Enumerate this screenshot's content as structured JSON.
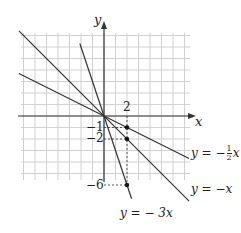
{
  "axes": {
    "x_label": "x",
    "y_label": "y"
  },
  "ticks": {
    "x_2": "2",
    "y_neg1": "−1",
    "y_neg2": "−2",
    "y_neg6": "−6"
  },
  "lines": [
    {
      "equation": "y = −½ x",
      "slope": -0.5,
      "label_pre": "y = −",
      "frac_num": "1",
      "frac_den": "2",
      "label_post": "x"
    },
    {
      "equation": "y = −x",
      "slope": -1,
      "label": "y = −x"
    },
    {
      "equation": "y = −3x",
      "slope": -3,
      "label": "y = − 3x"
    }
  ],
  "points": [
    {
      "x": 2,
      "y": -1
    },
    {
      "x": 2,
      "y": -2
    },
    {
      "x": 2,
      "y": -6
    }
  ],
  "colors": {
    "grid": "#d0d0d0",
    "axis": "#333333",
    "line": "#333333"
  }
}
